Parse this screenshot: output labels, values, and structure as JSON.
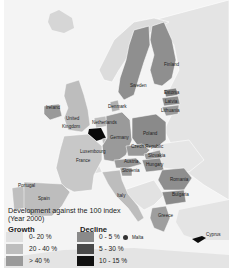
{
  "legend": {
    "title": "Development against the 100 index",
    "subtitle": "(Year 2000)",
    "growth": {
      "heading": "Growth",
      "items": [
        {
          "label": "0- 20 %",
          "color": "#e1e1e1"
        },
        {
          "label": "20 - 40 %",
          "color": "#bdbdbd"
        },
        {
          "label": "> 40 %",
          "color": "#9a9a9a"
        }
      ]
    },
    "decline": {
      "heading": "Decline",
      "items": [
        {
          "label": "0 - 5 %",
          "color": "#8a8a8a"
        },
        {
          "label": "5 - 30 %",
          "color": "#4a4a4a"
        },
        {
          "label": "10 - 15 %",
          "color": "#111111"
        }
      ]
    }
  },
  "countries": {
    "finland": "Finland",
    "sweden": "Sweden",
    "estonia": "Estonia",
    "latvia": "Latvia",
    "lithuania": "Lithuania",
    "denmark": "Denmark",
    "ireland": "Ireland",
    "united_kingdom_1": "United",
    "united_kingdom_2": "Kingdom",
    "netherlands": "Netherlands",
    "germany": "Germany",
    "poland": "Poland",
    "luxembourg": "Luxembourg",
    "czech": "Czech Republic",
    "slovakia": "Slovakia",
    "austria": "Austria",
    "hungary": "Hungary",
    "slovenia": "Slovenia",
    "france": "France",
    "romania": "Romania",
    "portugal": "Portugal",
    "spain": "Spain",
    "italy": "Italy",
    "bulgaria": "Bulgaria",
    "greece": "Greece",
    "malta": "Malta",
    "cyprus": "Cyprus"
  }
}
